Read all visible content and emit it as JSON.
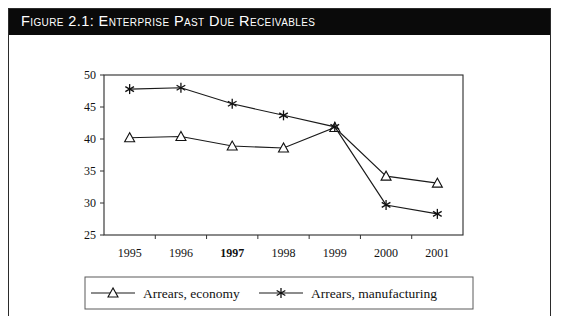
{
  "figure": {
    "title": "Figure 2.1:  Enterprise Past Due Receivables",
    "background_color": "#ffffff",
    "title_bar_color": "#0a0a0a",
    "title_text_color": "#ffffff",
    "border_color": "#2b2b2b"
  },
  "chart_data": {
    "type": "line",
    "title": "Figure 2.1:  Enterprise Past Due Receivables",
    "xlabel": "",
    "ylabel": "",
    "categories": [
      "1995",
      "1996",
      "1997",
      "1998",
      "1999",
      "2000",
      "2001"
    ],
    "series": [
      {
        "name": "Arrears, economy",
        "marker": "open-triangle",
        "values": [
          40.2,
          40.4,
          38.9,
          38.6,
          41.8,
          34.2,
          33.1
        ]
      },
      {
        "name": "Arrears, manufacturing",
        "marker": "asterisk",
        "values": [
          47.8,
          48.0,
          45.5,
          43.7,
          41.9,
          29.7,
          28.3
        ]
      }
    ],
    "ylim": [
      25,
      50
    ],
    "ytick_labels": [
      "25",
      "30",
      "35",
      "40",
      "45",
      "50"
    ],
    "ytick_values": [
      25,
      30,
      35,
      40,
      45,
      50
    ],
    "grid": false,
    "legend_position": "bottom",
    "line_color": "#1a1a1a"
  },
  "legend": {
    "entries": [
      {
        "label": "Arrears, economy",
        "marker": "open-triangle"
      },
      {
        "label": "Arrears, manufacturing",
        "marker": "asterisk"
      }
    ]
  },
  "caption": {
    "partial_text": ""
  }
}
